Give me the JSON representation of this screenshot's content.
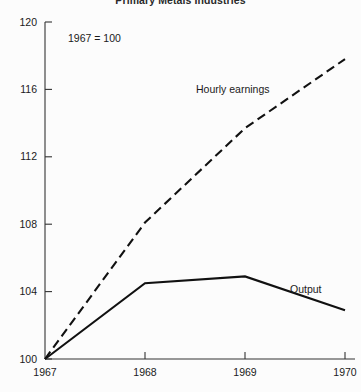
{
  "chart_data": {
    "type": "line",
    "title": "Primary Metals Industries",
    "subtitle": "",
    "annotation": "1967 = 100",
    "xlabel": "",
    "ylabel": "",
    "x": [
      1967,
      1968,
      1969,
      1970
    ],
    "xticklabels": [
      "1967",
      "1968",
      "1969",
      "1970"
    ],
    "xlim": [
      1967,
      1970
    ],
    "ylim": [
      100,
      120
    ],
    "yticks": [
      100,
      104,
      108,
      112,
      116,
      120
    ],
    "yticklabels": [
      "100",
      "104",
      "108",
      "112",
      "116",
      "120"
    ],
    "grid": false,
    "legend_position": "inline-annotations",
    "series": [
      {
        "name": "Hourly earnings",
        "style": "dashed",
        "color": "#111111",
        "values": [
          100,
          108.1,
          113.7,
          117.8
        ],
        "label": "Hourly earnings"
      },
      {
        "name": "Output",
        "style": "solid",
        "color": "#111111",
        "values": [
          100,
          104.5,
          104.9,
          102.9
        ],
        "label": "Output"
      }
    ]
  },
  "labels": {
    "hourly_earnings": "Hourly earnings",
    "output": "Output",
    "base_note": "1967 = 100",
    "title": "Primary Metals Industries"
  },
  "colors": {
    "background": "#fcfcfc",
    "ink": "#111111",
    "axis": "#333333"
  }
}
